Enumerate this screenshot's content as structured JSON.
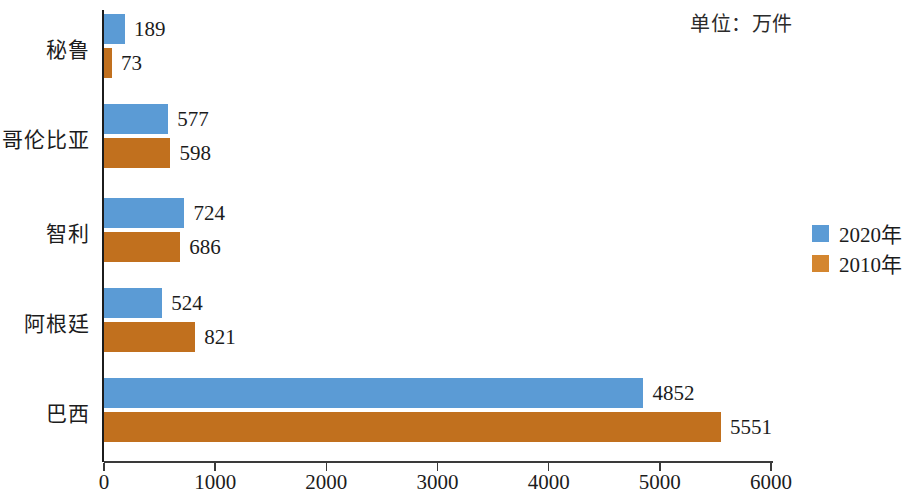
{
  "unit_note": "单位：万件",
  "legend": {
    "position": "right-middle",
    "items": [
      {
        "label": "2020年",
        "color": "#5b9bd5",
        "swatch_name": "legend-swatch-2020"
      },
      {
        "label": "2010年",
        "color": "#d4862f",
        "swatch_name": "legend-swatch-2010"
      }
    ]
  },
  "axis": {
    "ticks": [
      0,
      1000,
      2000,
      3000,
      4000,
      5000,
      6000
    ],
    "tick_labels": [
      "0",
      "1000",
      "2000",
      "3000",
      "4000",
      "5000",
      "6000"
    ],
    "min": 0,
    "max": 6000
  },
  "chart_data": {
    "type": "bar",
    "orientation": "horizontal",
    "title": "",
    "subtitle": "",
    "xlabel": "",
    "ylabel": "",
    "annotations": [
      "单位：万件"
    ],
    "grid": false,
    "legend_position": "right",
    "xlim": [
      0,
      6000
    ],
    "xticks": [
      0,
      1000,
      2000,
      3000,
      4000,
      5000,
      6000
    ],
    "categories": [
      "秘鲁",
      "哥伦比亚",
      "智利",
      "阿根廷",
      "巴西"
    ],
    "series": [
      {
        "name": "2020年",
        "color": "#5b9bd5",
        "values": [
          189,
          577,
          724,
          524,
          4852
        ]
      },
      {
        "name": "2010年",
        "color": "#c1701e",
        "values": [
          73,
          598,
          686,
          821,
          5551
        ]
      }
    ]
  }
}
